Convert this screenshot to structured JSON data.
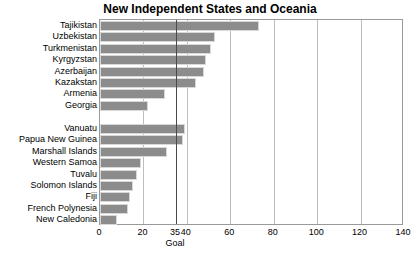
{
  "chart_data": {
    "type": "bar",
    "orientation": "horizontal",
    "title": "New Independent States and Oceania",
    "xlabel": "",
    "ylabel": "",
    "xlim": [
      0,
      140
    ],
    "xticks": [
      0,
      20,
      35,
      40,
      60,
      80,
      100,
      120,
      140
    ],
    "xtick_labels": [
      "0",
      "20",
      "35",
      "40",
      "60",
      "80",
      "100",
      "120",
      "140"
    ],
    "gridlines": [
      20,
      40,
      60,
      80,
      100,
      120
    ],
    "grid": true,
    "legend": null,
    "annotations": [
      {
        "label": "Goal",
        "value": 35,
        "type": "vertical-reference-line"
      }
    ],
    "groups": [
      {
        "name": "New Independent States",
        "categories": [
          "Tajikistan",
          "Uzbekistan",
          "Turkmenistan",
          "Kyrgyzstan",
          "Azerbaijan",
          "Kazakstan",
          "Armenia",
          "Georgia"
        ],
        "values": [
          73,
          53,
          51,
          49,
          48,
          44,
          30,
          22
        ]
      },
      {
        "name": "Oceania",
        "categories": [
          "Vanuatu",
          "Papua New Guinea",
          "Marshall Islands",
          "Western Samoa",
          "Tuvalu",
          "Solomon Islands",
          "Fiji",
          "French Polynesia",
          "New Caledonia"
        ],
        "values": [
          39,
          38,
          31,
          19,
          17,
          15,
          14,
          13,
          8
        ]
      }
    ],
    "categories": [
      "Tajikistan",
      "Uzbekistan",
      "Turkmenistan",
      "Kyrgyzstan",
      "Azerbaijan",
      "Kazakstan",
      "Armenia",
      "Georgia",
      "",
      "Vanuatu",
      "Papua New Guinea",
      "Marshall Islands",
      "Western Samoa",
      "Tuvalu",
      "Solomon Islands",
      "Fiji",
      "French Polynesia",
      "New Caledonia"
    ],
    "values": [
      73,
      53,
      51,
      49,
      48,
      44,
      30,
      22,
      null,
      39,
      38,
      31,
      19,
      17,
      15,
      14,
      13,
      8
    ],
    "bar_color": "#8c8c8c",
    "goal_line_color": "#4a4a4a",
    "grid_color": "#bdbdbd",
    "axis_color": "#9a9a9a"
  }
}
